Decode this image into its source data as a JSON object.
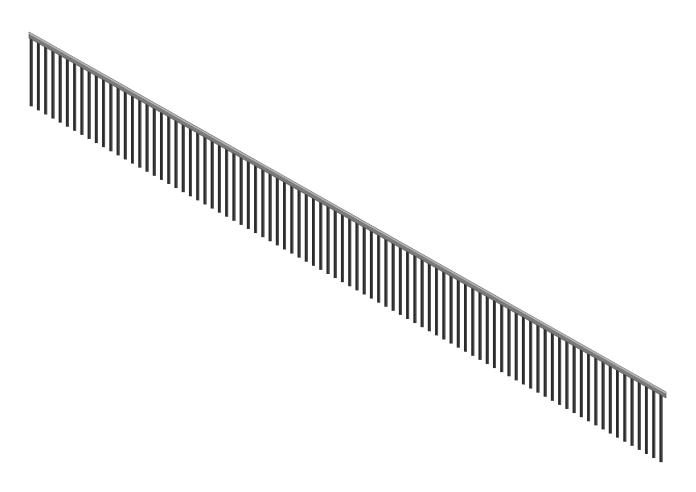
{
  "image": {
    "subject": "collated nail strip",
    "description": "Isometric illustration of a long strip of collated nails/brads joined by a slanted top bar",
    "background": "#ffffff"
  },
  "strip": {
    "start": {
      "x": 29,
      "y": 33
    },
    "end": {
      "x": 666,
      "y": 393
    },
    "bar_color": "#7a7a7a",
    "bar_highlight": "#b5b5b5",
    "bar_thickness": 5
  },
  "nails": {
    "count": 88,
    "length": 70,
    "width": 3,
    "color": "#2a2a2a",
    "shade_color": "#555555"
  }
}
